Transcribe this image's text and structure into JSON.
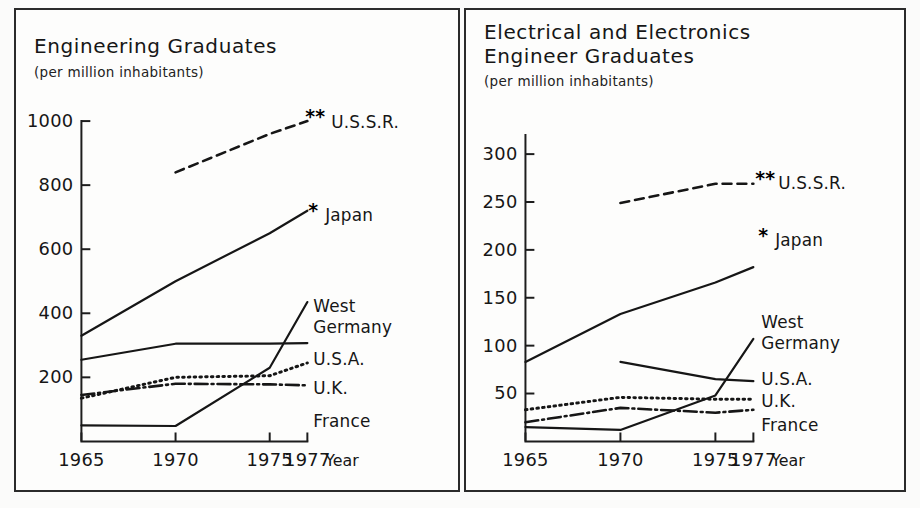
{
  "figure": {
    "background": "#fbfbfa",
    "ink": "#161616"
  },
  "panels": [
    {
      "id": "engineering-graduates",
      "title": "Engineering Graduates",
      "subtitle": "(per million inhabitants)",
      "axis_caption": "Year"
    },
    {
      "id": "electrical-electronics-graduates",
      "title_line1": "Electrical and Electronics",
      "title_line2": "Engineer Graduates",
      "subtitle": "(per million inhabitants)",
      "axis_caption": "Year"
    }
  ],
  "chart_data": [
    {
      "type": "line",
      "title": "Engineering Graduates",
      "subtitle": "(per million inhabitants)",
      "xlabel": "Year",
      "ylabel": "(per million inhabitants)",
      "xlim": [
        1965,
        1977
      ],
      "ylim": [
        0,
        1000
      ],
      "xticks": [
        1965,
        1970,
        1975,
        1977
      ],
      "xtick_labels": [
        "1965",
        "1970",
        "1975",
        "1977"
      ],
      "yticks": [
        200,
        400,
        600,
        800,
        1000
      ],
      "ytick_labels": [
        "200",
        "400",
        "600",
        "800",
        "1000"
      ],
      "grid": false,
      "legend_position": "right-of-line-ends",
      "series": [
        {
          "name": "U.S.S.R.",
          "label": "U.S.S.R.",
          "note": "**",
          "style": "dashed",
          "x": [
            1970,
            1975,
            1977
          ],
          "values": [
            840,
            960,
            1000
          ]
        },
        {
          "name": "Japan",
          "label": "Japan",
          "note": "*",
          "style": "solid",
          "x": [
            1965,
            1970,
            1975,
            1977
          ],
          "values": [
            330,
            500,
            650,
            720
          ]
        },
        {
          "name": "West Germany",
          "label": "West\nGermany",
          "note": "",
          "style": "solid",
          "x": [
            1965,
            1970,
            1975,
            1977
          ],
          "values": [
            50,
            48,
            230,
            435
          ]
        },
        {
          "name": "U.S.A.",
          "label": "U.S.A.",
          "note": "",
          "style": "solid",
          "x": [
            1965,
            1970,
            1975,
            1977
          ],
          "values": [
            255,
            305,
            305,
            307
          ]
        },
        {
          "name": "U.K.",
          "label": "U.K.",
          "note": "",
          "style": "dotted",
          "x": [
            1965,
            1970,
            1975,
            1977
          ],
          "values": [
            135,
            200,
            205,
            245
          ]
        },
        {
          "name": "France",
          "label": "France",
          "note": "",
          "style": "dashdot",
          "x": [
            1965,
            1970,
            1975,
            1977
          ],
          "values": [
            145,
            180,
            178,
            175
          ]
        }
      ]
    },
    {
      "type": "line",
      "title": "Electrical and Electronics Engineer Graduates",
      "subtitle": "(per million inhabitants)",
      "xlabel": "Year",
      "ylabel": "(per million inhabitants)",
      "xlim": [
        1965,
        1977
      ],
      "ylim": [
        0,
        320
      ],
      "xticks": [
        1965,
        1970,
        1975,
        1977
      ],
      "xtick_labels": [
        "1965",
        "1970",
        "1975",
        "1977"
      ],
      "yticks": [
        50,
        100,
        150,
        200,
        250,
        300
      ],
      "ytick_labels": [
        "50",
        "100",
        "150",
        "200",
        "250",
        "300"
      ],
      "grid": false,
      "legend_position": "right-of-line-ends",
      "series": [
        {
          "name": "U.S.S.R.",
          "label": "U.S.S.R.",
          "note": "**",
          "style": "dashed",
          "x": [
            1970,
            1975,
            1977
          ],
          "values": [
            249,
            269,
            269
          ]
        },
        {
          "name": "Japan",
          "label": "Japan",
          "note": "*",
          "style": "solid",
          "x": [
            1965,
            1970,
            1975,
            1977
          ],
          "values": [
            83,
            133,
            166,
            182
          ]
        },
        {
          "name": "West Germany",
          "label": "West\nGermany",
          "note": "",
          "style": "solid",
          "x": [
            1965,
            1970,
            1975,
            1977
          ],
          "values": [
            15,
            12,
            48,
            107
          ]
        },
        {
          "name": "U.S.A.",
          "label": "U.S.A.",
          "note": "",
          "style": "solid",
          "x": [
            1970,
            1975,
            1977
          ],
          "values": [
            83,
            65,
            63
          ]
        },
        {
          "name": "U.K.",
          "label": "U.K.",
          "note": "",
          "style": "dotted",
          "x": [
            1965,
            1970,
            1975,
            1977
          ],
          "values": [
            33,
            46,
            44,
            44
          ]
        },
        {
          "name": "France",
          "label": "France",
          "note": "",
          "style": "dashdot",
          "x": [
            1965,
            1970,
            1975,
            1977
          ],
          "values": [
            20,
            35,
            30,
            33
          ]
        }
      ]
    }
  ]
}
